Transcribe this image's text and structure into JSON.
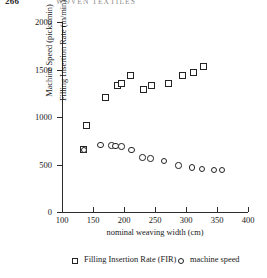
{
  "running_head": {
    "page_number": "266",
    "title": "WOVEN TEXTILES"
  },
  "chart_data": {
    "type": "scatter",
    "title": "",
    "xlabel": "nominal weaving width (cm)",
    "ylabel": "Filling Insertion Rate (m/min)  Machine Speed (picks/min)",
    "ylabel_part1": "Filling Insertion Rate (m/min)",
    "ylabel_part2": "Machine Speed (picks/min)",
    "xlim": [
      100,
      400
    ],
    "ylim": [
      0,
      2000
    ],
    "xticks": [
      100,
      150,
      200,
      250,
      300,
      350,
      400
    ],
    "yticks": [
      0,
      500,
      1000,
      1500,
      2000
    ],
    "grid": false,
    "legend_position": "below-plot",
    "series": [
      {
        "name": "Filling Insertion Rate (FIR)",
        "marker": "square",
        "points": [
          {
            "x": 140,
            "y": 910
          },
          {
            "x": 170,
            "y": 1205
          },
          {
            "x": 190,
            "y": 1330
          },
          {
            "x": 196,
            "y": 1355
          },
          {
            "x": 210,
            "y": 1435
          },
          {
            "x": 232,
            "y": 1285
          },
          {
            "x": 245,
            "y": 1330
          },
          {
            "x": 272,
            "y": 1355
          },
          {
            "x": 295,
            "y": 1440
          },
          {
            "x": 312,
            "y": 1465
          },
          {
            "x": 328,
            "y": 1530
          },
          {
            "x": 135,
            "y": 655
          }
        ]
      },
      {
        "name": "machine speed",
        "marker": "circle",
        "points": [
          {
            "x": 135,
            "y": 655
          },
          {
            "x": 162,
            "y": 705
          },
          {
            "x": 180,
            "y": 700
          },
          {
            "x": 186,
            "y": 697
          },
          {
            "x": 196,
            "y": 690
          },
          {
            "x": 212,
            "y": 655
          },
          {
            "x": 230,
            "y": 575
          },
          {
            "x": 243,
            "y": 565
          },
          {
            "x": 265,
            "y": 540
          },
          {
            "x": 288,
            "y": 490
          },
          {
            "x": 310,
            "y": 470
          },
          {
            "x": 326,
            "y": 452
          },
          {
            "x": 345,
            "y": 445
          },
          {
            "x": 358,
            "y": 440
          }
        ]
      }
    ]
  },
  "legend": {
    "items": [
      {
        "label": "Filling Insertion Rate (FIR)",
        "marker": "square"
      },
      {
        "label": "machine speed",
        "marker": "circle"
      }
    ]
  }
}
